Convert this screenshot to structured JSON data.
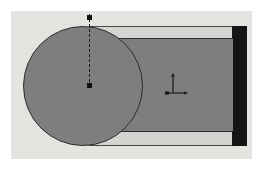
{
  "drawing": {
    "title": "Keyhole Shaft Part Outline",
    "view_type": "2D orthographic plan view",
    "background_color": "#e6e6e3",
    "page_color": "#ffffff",
    "body_fill_color": "#7f7f7f",
    "outline_color": "#2e2e2e",
    "end_block_color": "#141414",
    "shoulder_color": "#d6d6d3",
    "centerline_color": "#1a1a1a"
  },
  "features": {
    "circular_head": {
      "name": "circular head",
      "shape": "circle",
      "fill": "#7f7f7f",
      "diameter_px": 120
    },
    "shaft": {
      "name": "rectangular shaft",
      "shape": "rectangle",
      "fill": "#7f7f7f",
      "width_px": 132,
      "height_px": 94
    },
    "shoulder_top": {
      "name": "upper shoulder band",
      "fill": "#d6d6d3"
    },
    "shoulder_bottom": {
      "name": "lower shoulder band",
      "fill": "#d6d6d3"
    },
    "end_block": {
      "name": "end block",
      "shape": "rectangle",
      "fill": "#141414",
      "width_px": 15,
      "height_px": 120
    },
    "end_slot": {
      "name": "end slot",
      "fill": "#7f7f7f"
    }
  },
  "annotations": {
    "centerline": {
      "name": "vertical centerline",
      "style": "dashed",
      "color": "#1a1a1a"
    },
    "datum_top": {
      "name": "top datum point marker",
      "color": "#111111"
    },
    "datum_center": {
      "name": "circle center point marker",
      "color": "#111111"
    },
    "ucs_icon": {
      "name": "coordinate system icon",
      "axes": [
        "Y",
        "X"
      ],
      "color": "#1a1a1a"
    }
  }
}
